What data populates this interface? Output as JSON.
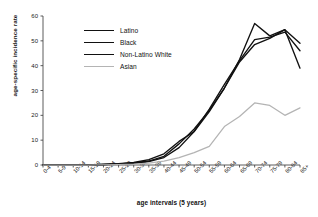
{
  "chart_data": {
    "type": "line",
    "title": "",
    "xlabel": "age intervals (5 years)",
    "ylabel": "age-specific incidence rate",
    "categories": [
      "0-4",
      "5-9",
      "10-14",
      "15-19",
      "20-24",
      "25-29",
      "30-34",
      "35-39",
      "40-44",
      "45-49",
      "50-54",
      "55-59",
      "60-64",
      "65-69",
      "70-74",
      "75-79",
      "80-84",
      "85+"
    ],
    "yticks": [
      0,
      10,
      20,
      30,
      40,
      50,
      60
    ],
    "ylim": [
      0,
      60
    ],
    "grid": false,
    "legend_position": "upper-left",
    "series": [
      {
        "name": "Latino",
        "color": "#111111",
        "values": [
          0,
          0,
          0,
          0,
          0.2,
          0.4,
          0.8,
          1.6,
          3.5,
          8.5,
          14.5,
          22.0,
          31.0,
          42.5,
          57.0,
          52.0,
          54.5,
          39.0
        ]
      },
      {
        "name": "Black",
        "color": "#111111",
        "values": [
          0,
          0,
          0,
          0,
          0.2,
          0.5,
          1.0,
          2.2,
          4.5,
          9.5,
          13.5,
          21.5,
          31.0,
          41.5,
          48.5,
          51.0,
          54.5,
          49.0
        ]
      },
      {
        "name": "Non-Latino White",
        "color": "#111111",
        "values": [
          0,
          0,
          0,
          0,
          0.2,
          0.4,
          0.7,
          1.4,
          3.0,
          7.0,
          13.5,
          22.5,
          32.5,
          42.0,
          50.5,
          51.5,
          53.5,
          46.0
        ]
      },
      {
        "name": "Asian",
        "color": "#b4b4b4",
        "values": [
          0,
          0,
          0,
          0,
          0.1,
          0.2,
          0.4,
          0.8,
          1.6,
          3.0,
          5.0,
          7.5,
          15.5,
          19.5,
          25.0,
          24.0,
          20.0,
          23.0
        ]
      }
    ]
  },
  "legend": {
    "items": [
      {
        "label": "Latino"
      },
      {
        "label": "Black"
      },
      {
        "label": "Non-Latino White"
      },
      {
        "label": "Asian"
      }
    ]
  }
}
